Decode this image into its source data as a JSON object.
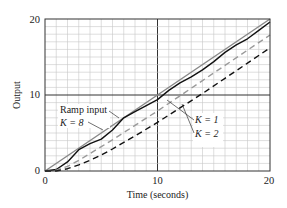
{
  "chart_data": {
    "type": "line",
    "title": "",
    "xlabel": "Time (seconds)",
    "ylabel": "Output",
    "xlim": [
      0,
      20
    ],
    "ylim": [
      0,
      20
    ],
    "xticks": [
      0,
      10,
      20
    ],
    "yticks": [
      0,
      10,
      20
    ],
    "grid": true,
    "grid_step": 1,
    "annotations": [
      {
        "text": "Ramp input",
        "target": "Ramp input"
      },
      {
        "text": "K = 8",
        "target": "K = 8"
      },
      {
        "text": "K = 1",
        "target": "K = 1"
      },
      {
        "text": "K = 2",
        "target": "K = 2"
      }
    ],
    "series": [
      {
        "name": "Ramp input",
        "style": "solid",
        "color": "#888888",
        "x": [
          0,
          20
        ],
        "y": [
          0,
          20
        ]
      },
      {
        "name": "K = 8",
        "style": "solid",
        "color": "#111111",
        "x": [
          0,
          1,
          2,
          3,
          4,
          5,
          6,
          7,
          8,
          9,
          10,
          11,
          12,
          13,
          14,
          15,
          16,
          17,
          18,
          19,
          20
        ],
        "y": [
          0,
          0.2,
          1.2,
          2.8,
          3.6,
          4.2,
          5.4,
          7.0,
          7.8,
          8.6,
          9.4,
          10.6,
          11.6,
          12.4,
          13.3,
          14.4,
          15.6,
          16.6,
          17.4,
          18.5,
          19.6
        ]
      },
      {
        "name": "K = 2",
        "style": "dashed",
        "color": "#999999",
        "x": [
          0,
          1,
          2,
          3,
          4,
          5,
          6,
          8,
          10,
          12,
          14,
          16,
          18,
          20
        ],
        "y": [
          0,
          0.1,
          0.6,
          1.4,
          2.3,
          3.2,
          4.1,
          6.0,
          7.9,
          9.9,
          11.9,
          13.9,
          15.9,
          17.9
        ]
      },
      {
        "name": "K = 1",
        "style": "dashed",
        "color": "#111111",
        "x": [
          0,
          1,
          2,
          3,
          4,
          5,
          6,
          8,
          10,
          12,
          14,
          16,
          18,
          20
        ],
        "y": [
          0,
          0.0,
          0.3,
          0.8,
          1.4,
          2.1,
          2.9,
          4.6,
          6.4,
          8.3,
          10.2,
          12.2,
          14.2,
          16.2
        ]
      }
    ]
  },
  "labels": {
    "xlabel": "Time (seconds)",
    "ylabel": "Output",
    "ramp": "Ramp input",
    "k8": "K = 8",
    "k1": "K = 1",
    "k2": "K = 2",
    "x0": "0",
    "x10": "10",
    "x20": "20",
    "y0": "0",
    "y10": "10",
    "y20": "20"
  }
}
